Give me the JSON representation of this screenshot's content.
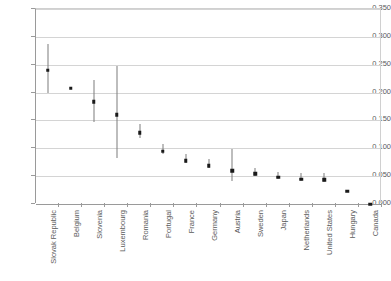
{
  "chart_data": {
    "type": "scatter",
    "title": "",
    "xlabel": "",
    "ylabel": "",
    "ylim": [
      0.0,
      0.35
    ],
    "yticks": [
      "0.000",
      "0.050",
      "0.100",
      "0.150",
      "0.200",
      "0.250",
      "0.300",
      "0.350"
    ],
    "ytick_values": [
      0.0,
      0.05,
      0.1,
      0.15,
      0.2,
      0.25,
      0.3,
      0.35
    ],
    "grid": "horizontal",
    "legend": "none",
    "error_bars": true,
    "categories": [
      "Slovak Republic",
      "Belgium",
      "Slovenia",
      "Luxembourg",
      "Romania",
      "Portugal",
      "France",
      "Germany",
      "Austria",
      "Sweden",
      "Japan",
      "Netherlands",
      "United States",
      "Hungary",
      "Canada"
    ],
    "values": [
      0.243,
      0.211,
      0.187,
      0.163,
      0.131,
      0.098,
      0.081,
      0.072,
      0.063,
      0.057,
      0.051,
      0.048,
      0.047,
      0.026,
      0.003
    ],
    "ci_low": [
      0.2,
      null,
      0.148,
      0.082,
      0.119,
      0.09,
      0.074,
      0.064,
      0.042,
      0.05,
      0.044,
      0.042,
      0.04,
      null,
      null
    ],
    "ci_high": [
      0.287,
      null,
      0.222,
      0.248,
      0.143,
      0.107,
      0.089,
      0.08,
      0.098,
      0.065,
      0.058,
      0.055,
      0.055,
      null,
      null
    ],
    "marker_color": "#1a1a1a",
    "errorbar_color": "#7d7d7d",
    "gridline_color": "#d4d4d4",
    "axis_color": "#9a9a9a"
  }
}
